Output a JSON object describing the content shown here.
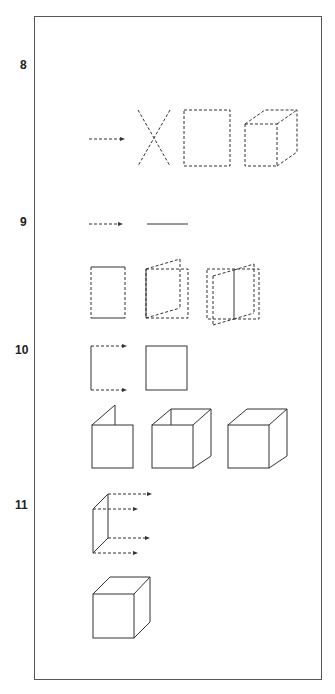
{
  "figure": {
    "steps": [
      {
        "label": "8",
        "description": "point moves to line, lines to plane, plane to dashed cube"
      },
      {
        "label": "9",
        "description": "dashed arrow becomes solid line; rectangles with swinging planes"
      },
      {
        "label": "10",
        "description": "dashed arrows sweep to form square"
      },
      {
        "label": "11",
        "description": "folded planes build into cube; edge sweeps create solid cube"
      }
    ],
    "colors": {
      "line": "#333333",
      "frame": "#555555",
      "background": "#ffffff"
    }
  }
}
